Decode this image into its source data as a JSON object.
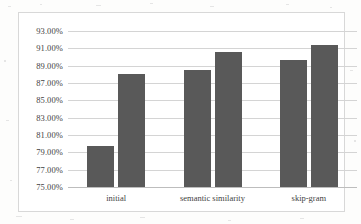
{
  "chart_data": {
    "type": "bar",
    "title": "",
    "subtitle": "",
    "xlabel": "",
    "ylabel": "",
    "categories": [
      "initial",
      "semantic similarity",
      "skip-gram"
    ],
    "series": [
      {
        "name": "series-1",
        "values": [
          79.7,
          88.5,
          89.7
        ]
      },
      {
        "name": "series-2",
        "values": [
          88.05,
          90.6,
          91.4
        ]
      }
    ],
    "ylim": [
      75.0,
      93.0
    ],
    "ytick_values": [
      75.0,
      77.0,
      79.0,
      81.0,
      83.0,
      85.0,
      87.0,
      89.0,
      91.0,
      93.0
    ],
    "ytick_labels": [
      "75.00%",
      "77.00%",
      "79.00%",
      "81.00%",
      "83.00%",
      "85.00%",
      "87.00%",
      "89.00%",
      "91.00%",
      "93.00%"
    ],
    "grid": true,
    "legend": false,
    "legend_position": "none",
    "bar_color": "#595959",
    "gridline_color": "#d4d4d4",
    "frame_color": "#d8d8d8",
    "plot_background": "#ffffff",
    "annotations": []
  }
}
